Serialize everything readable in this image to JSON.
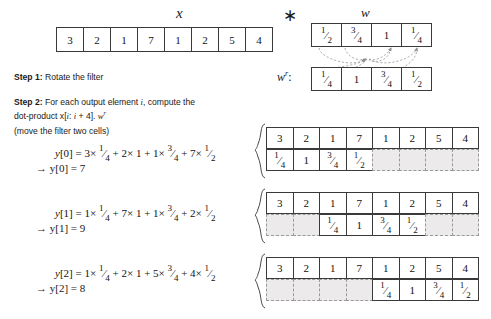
{
  "input": {
    "label": "x",
    "values": [
      "3",
      "2",
      "1",
      "7",
      "1",
      "2",
      "5",
      "4"
    ]
  },
  "operator": {
    "symbol": "∗",
    "name": "convolution-operator"
  },
  "filter": {
    "label": "w",
    "values": [
      {
        "num": "1",
        "den": "2",
        "text": "1/2"
      },
      {
        "num": "3",
        "den": "4",
        "text": "3/4"
      },
      {
        "num": "1",
        "den": "",
        "text": "1"
      },
      {
        "num": "1",
        "den": "4",
        "text": "1/4"
      }
    ]
  },
  "filter_reversed": {
    "label": "w",
    "superscript": "r",
    "label_suffix": ":",
    "values": [
      {
        "num": "1",
        "den": "4",
        "text": "1/4"
      },
      {
        "num": "1",
        "den": "",
        "text": "1"
      },
      {
        "num": "3",
        "den": "4",
        "text": "3/4"
      },
      {
        "num": "1",
        "den": "2",
        "text": "1/2"
      }
    ]
  },
  "steps": [
    {
      "id": "step-1",
      "bold": "Step 1:",
      "text": " Rotate the filter"
    },
    {
      "id": "step-2",
      "bold": "Step 2:",
      "text_part1": " For each output element ",
      "var1": "i",
      "text_part2": ", compute the",
      "line2_part1": "dot-product x[",
      "line2_var": "i",
      "line2_part2": ": ",
      "line2_var2": "i",
      "line2_part3": " + 4]. ",
      "line2_wr": "w",
      "line2_wr_sup": "r"
    }
  ],
  "note": "(move the filter two cells)",
  "outputs": [
    {
      "name": "y0",
      "lhs": "y[0]",
      "eq": "=",
      "terms": [
        {
          "coef": "3",
          "times": "×",
          "frac_num": "1",
          "frac_den": "4"
        },
        {
          "coef": "2",
          "times": "×",
          "frac_num": "1",
          "frac_den": ""
        },
        {
          "coef": "1",
          "times": "×",
          "frac_num": "3",
          "frac_den": "4"
        },
        {
          "coef": "7",
          "times": "×",
          "frac_num": "1",
          "frac_den": "2"
        }
      ],
      "result_arrow": "→",
      "result_lhs": "y[0]",
      "result_value": "7",
      "offset": 0
    },
    {
      "name": "y1",
      "lhs": "y[1]",
      "eq": "=",
      "terms": [
        {
          "coef": "1",
          "times": "×",
          "frac_num": "1",
          "frac_den": "4"
        },
        {
          "coef": "7",
          "times": "×",
          "frac_num": "1",
          "frac_den": ""
        },
        {
          "coef": "1",
          "times": "×",
          "frac_num": "3",
          "frac_den": "4"
        },
        {
          "coef": "2",
          "times": "×",
          "frac_num": "1",
          "frac_den": "2"
        }
      ],
      "result_arrow": "→",
      "result_lhs": "y[1]",
      "result_value": "9",
      "offset": 2
    },
    {
      "name": "y2",
      "lhs": "y[2]",
      "eq": "=",
      "terms": [
        {
          "coef": "1",
          "times": "×",
          "frac_num": "1",
          "frac_den": "4"
        },
        {
          "coef": "2",
          "times": "×",
          "frac_num": "1",
          "frac_den": ""
        },
        {
          "coef": "5",
          "times": "×",
          "frac_num": "3",
          "frac_den": "4"
        },
        {
          "coef": "4",
          "times": "×",
          "frac_num": "1",
          "frac_den": "2"
        }
      ],
      "result_arrow": "→",
      "result_lhs": "y[2]",
      "result_value": "8",
      "offset": 4
    }
  ],
  "panels": [
    {
      "name": "panel-y0",
      "data_row": [
        "3",
        "2",
        "1",
        "7",
        "1",
        "2",
        "5",
        "4"
      ],
      "filter_row": [
        "1/4",
        "1",
        "3/4",
        "1/2"
      ],
      "filter_start": 0
    },
    {
      "name": "panel-y1",
      "data_row": [
        "3",
        "2",
        "1",
        "7",
        "1",
        "2",
        "5",
        "4"
      ],
      "filter_row": [
        "1/4",
        "1",
        "3/4",
        "1/2"
      ],
      "filter_start": 2
    },
    {
      "name": "panel-y2",
      "data_row": [
        "3",
        "2",
        "1",
        "7",
        "1",
        "2",
        "5",
        "4"
      ],
      "filter_row": [
        "1/4",
        "1",
        "3/4",
        "1/2"
      ],
      "filter_start": 4
    }
  ],
  "colors": {
    "stroke": "#3a3a3a",
    "ghost_fill": "#eceaea",
    "ghost_stroke": "#9a9a9a",
    "text": "#1a1a1a",
    "background": "#ffffff"
  }
}
